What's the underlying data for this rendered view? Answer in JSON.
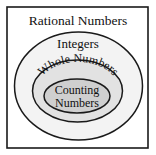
{
  "diagram": {
    "type": "nested-venn",
    "title": "Rational Numbers",
    "sets": [
      {
        "label": "Rational Numbers",
        "fill": "#ffffff"
      },
      {
        "label": "Integers",
        "fill": "#f3f3f3"
      },
      {
        "label": "Whole Numbers",
        "fill": "#e2e2e2"
      },
      {
        "label_line1": "Counting",
        "label_line2": "Numbers",
        "fill": "#cfcfcf"
      }
    ],
    "stroke": "#1a1a1a"
  }
}
